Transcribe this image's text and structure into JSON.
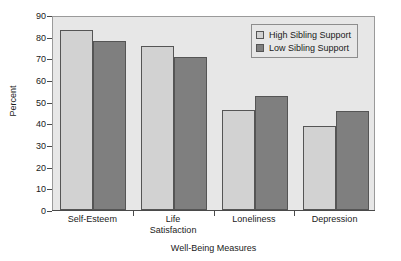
{
  "chart_data": {
    "type": "bar",
    "title": "",
    "xlabel": "Well-Being Measures",
    "ylabel": "Percent",
    "ylim": [
      0,
      90
    ],
    "ytick_step": 10,
    "yticks": [
      0,
      10,
      20,
      30,
      40,
      50,
      60,
      70,
      80,
      90
    ],
    "grid": false,
    "legend_position": "top-right",
    "categories": [
      "Self-Esteem",
      "Life\nSatisfaction",
      "Loneliness",
      "Depression"
    ],
    "series": [
      {
        "name": "High Sibling Support",
        "color": "#d2d2d2",
        "values": [
          83,
          75.5,
          46,
          39
        ]
      },
      {
        "name": "Low Sibling Support",
        "color": "#7f7f7f",
        "values": [
          78,
          70.5,
          52.5,
          45.5
        ]
      }
    ]
  },
  "axes": {
    "y_title": "Percent",
    "x_title": "Well-Being Measures",
    "y_tick_labels": [
      "90",
      "80",
      "70",
      "60",
      "50",
      "40",
      "30",
      "20",
      "10",
      "0"
    ],
    "x_tick_labels": [
      "Self-Esteem",
      "Life\nSatisfaction",
      "Loneliness",
      "Depression"
    ]
  },
  "legend": {
    "items": [
      {
        "label": "High Sibling Support",
        "swatch": "high"
      },
      {
        "label": "Low Sibling Support",
        "swatch": "low"
      }
    ]
  },
  "colors": {
    "high_support": "#d2d2d2",
    "low_support": "#7f7f7f",
    "plot_background": "#e7e7e7",
    "frame": "#9a9a9a",
    "bar_outline": "#555555",
    "text": "#1a1a1a"
  }
}
